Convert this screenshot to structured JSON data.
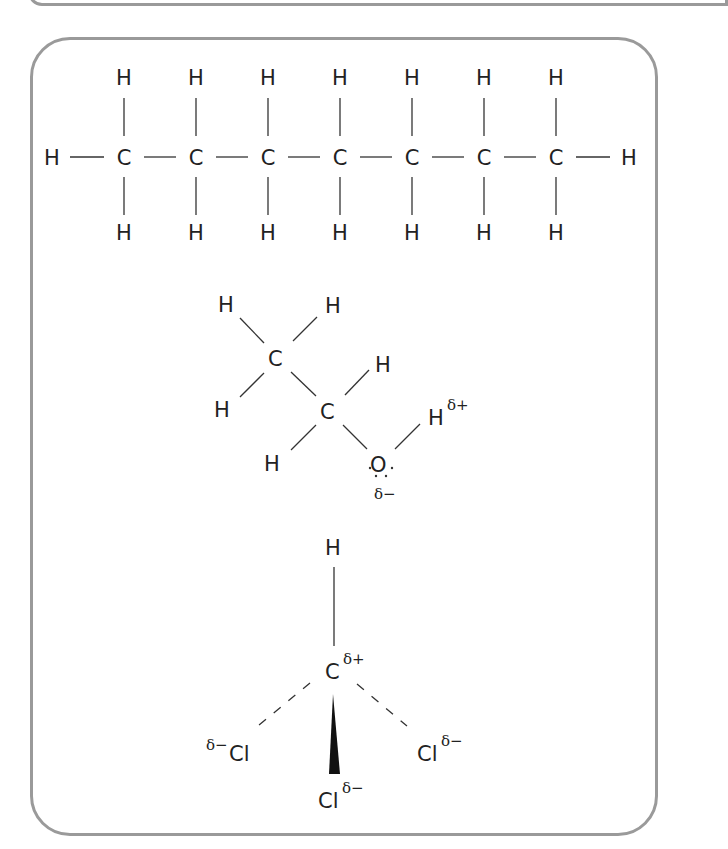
{
  "diagram": {
    "molecules": [
      {
        "name": "heptane",
        "carbon_count": 7,
        "carbon_symbol": "C",
        "hydrogen_symbol": "H"
      },
      {
        "name": "ethanol",
        "atoms": {
          "c1": "C",
          "c2": "C",
          "o": "O",
          "h1": "H",
          "h2": "H",
          "h3": "H",
          "h4": "H",
          "h5": "H",
          "ho": "H"
        },
        "charges": {
          "h_hydroxyl": "δ+",
          "oxygen": "δ−"
        }
      },
      {
        "name": "chloroform",
        "atoms": {
          "h": "H",
          "c": "C",
          "cl_left": "Cl",
          "cl_right": "Cl",
          "cl_bottom": "Cl"
        },
        "charges": {
          "carbon": "δ+",
          "cl_left": "δ−",
          "cl_right": "δ−",
          "cl_bottom": "δ−"
        }
      }
    ]
  }
}
